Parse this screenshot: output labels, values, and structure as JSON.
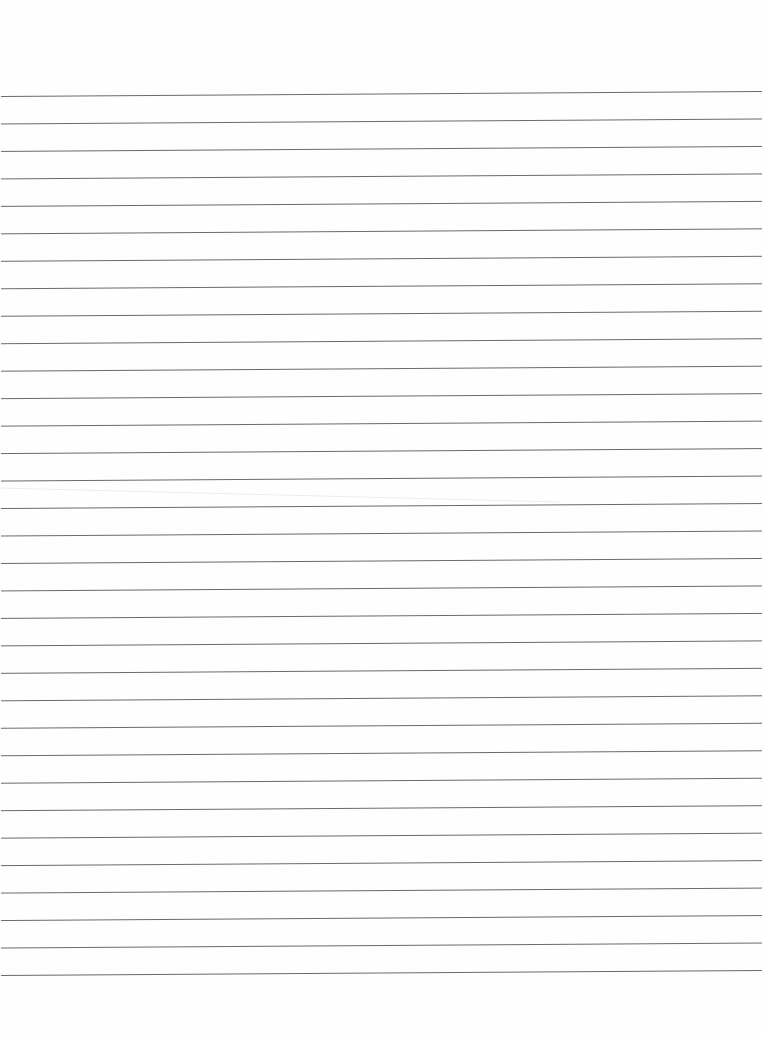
{
  "document": {
    "title": "Blank lined paper",
    "type": "lined-paper",
    "line_count": 33,
    "line_color": "#6a6a6a",
    "paper_color": "#fefefe",
    "text_content": ""
  }
}
